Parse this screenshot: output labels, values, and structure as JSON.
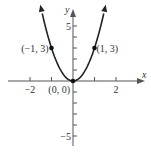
{
  "chart_data": {
    "type": "line",
    "title": "",
    "function": "y = 3x^2",
    "xlabel": "x",
    "ylabel": "y",
    "xlim": [
      -2.6,
      3.0
    ],
    "ylim": [
      -6.0,
      6.6
    ],
    "grid": false,
    "x_ticks": [
      -2,
      -1,
      1,
      2
    ],
    "x_tick_labels": [
      {
        "value": -2,
        "label": "−2"
      },
      {
        "value": 2,
        "label": "2"
      }
    ],
    "y_ticks": [
      -5,
      -4,
      -3,
      -2,
      -1,
      1,
      2,
      3,
      4,
      5
    ],
    "y_tick_labels": [
      {
        "value": 5,
        "label": "5"
      },
      {
        "value": -5,
        "label": "−5"
      }
    ],
    "series": [
      {
        "name": "parabola",
        "x": [
          -1.45,
          -1,
          -0.5,
          0,
          0.5,
          1,
          1.45
        ],
        "y": [
          6.3,
          3,
          0.75,
          0,
          0.75,
          3,
          6.3
        ]
      }
    ],
    "points": [
      {
        "x": -1,
        "y": 3,
        "label": "(−1, 3)"
      },
      {
        "x": 0,
        "y": 0,
        "label": "(0, 0)"
      },
      {
        "x": 1,
        "y": 3,
        "label": "(1, 3)"
      }
    ],
    "colors": {
      "axis": "#555555",
      "curve": "#222222",
      "text": "#333333"
    }
  }
}
